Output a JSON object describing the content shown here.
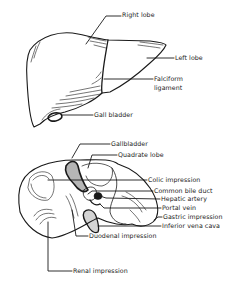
{
  "figure": {
    "top_view": {
      "labels": {
        "right_lobe": "Right lobe",
        "left_lobe": "Left lobe",
        "falciform_ligament_line1": "Falciform",
        "falciform_ligament_line2": "ligament",
        "gallbladder": "Gall bladder"
      }
    },
    "bottom_view": {
      "labels": {
        "gallbladder": "Gallbladder",
        "quadrate_lobe": "Quadrate lobe",
        "colic_impression": "Colic impression",
        "common_bile_duct": "Common bile duct",
        "hepatic_artery": "Hepatic artery",
        "portal_vein": "Portal vein",
        "gastric_impression": "Gastric impression",
        "inferior_vena_cava": "Inferior vena cava",
        "duodenal_impression": "Duodenal impression",
        "renal_impression": "Renal impression"
      }
    },
    "colors": {
      "ink": "#1a1a1a",
      "background": "#ffffff"
    }
  }
}
